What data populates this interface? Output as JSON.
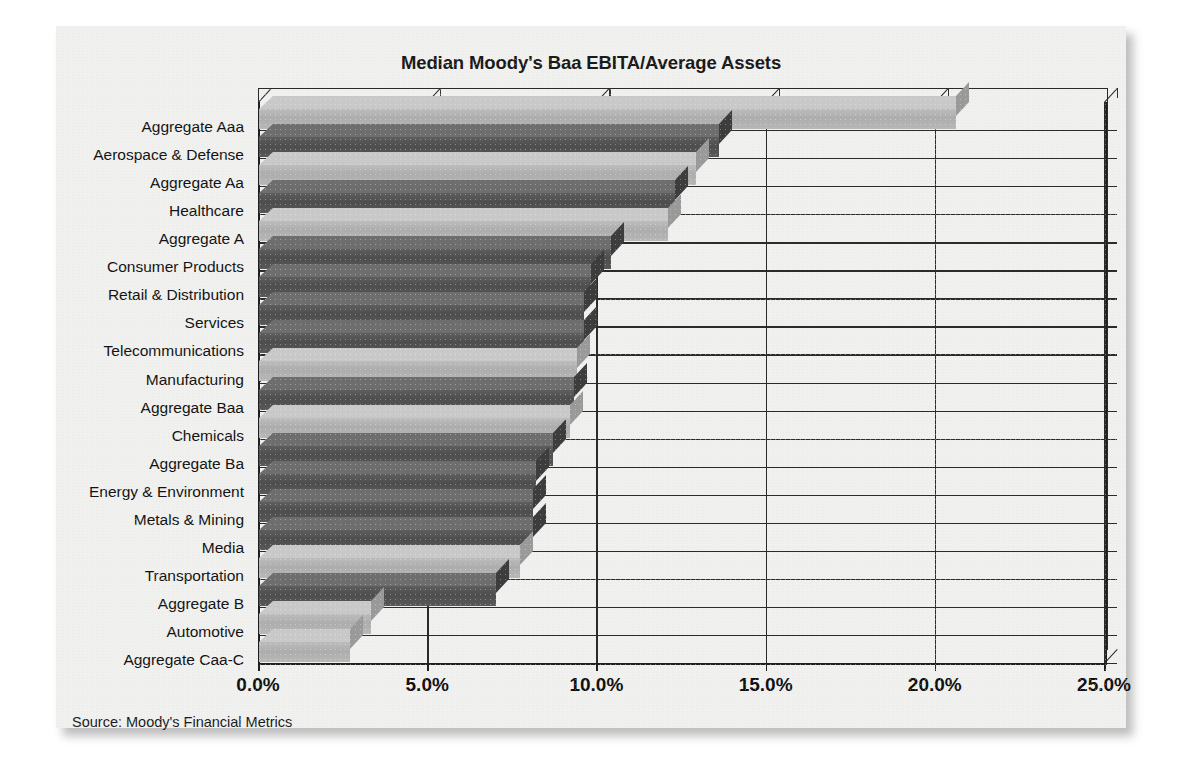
{
  "chart_data": {
    "type": "bar",
    "orientation": "horizontal",
    "title": "Median Moody's Baa EBITA/Average Assets",
    "xlabel": "",
    "ylabel": "",
    "xlim": [
      0,
      25
    ],
    "xticks": [
      "0.0%",
      "5.0%",
      "10.0%",
      "15.0%",
      "20.0%",
      "25.0%"
    ],
    "xtick_values": [
      0,
      5,
      10,
      15,
      20,
      25
    ],
    "grid": "vertical",
    "legend": "none",
    "units": "percent",
    "categories": [
      "Aggregate Aaa",
      "Aerospace & Defense",
      "Aggregate Aa",
      "Healthcare",
      "Aggregate A",
      "Consumer Products",
      "Retail & Distribution",
      "Services",
      "Telecommunications",
      "Manufacturing",
      "Aggregate Baa",
      "Chemicals",
      "Aggregate Ba",
      "Energy & Environment",
      "Metals & Mining",
      "Media",
      "Transportation",
      "Aggregate B",
      "Automotive",
      "Aggregate Caa-C"
    ],
    "values": [
      20.6,
      13.6,
      12.9,
      12.3,
      12.1,
      10.4,
      9.8,
      9.6,
      9.6,
      9.4,
      9.3,
      9.2,
      8.7,
      8.2,
      8.1,
      8.1,
      7.7,
      7.0,
      3.3,
      2.7
    ],
    "bar_shades": [
      "light",
      "dark",
      "light",
      "dark",
      "light",
      "dark",
      "dark",
      "dark",
      "dark",
      "light",
      "dark",
      "light",
      "dark",
      "dark",
      "dark",
      "dark",
      "light",
      "dark",
      "light",
      "light"
    ],
    "source": "Source: Moody's Financial Metrics"
  },
  "colors": {
    "bar_light_face": "#b4b4b4",
    "bar_light_top": "#c9c9c9",
    "bar_light_side": "#9a9a9a",
    "bar_dark_face": "#545454",
    "bar_dark_top": "#6e6e6e",
    "bar_dark_side": "#3d3d3d",
    "axis": "#1f1f1f",
    "grid": "#2b2b2b",
    "text": "#131313",
    "page_background": "#f0f0ee"
  }
}
